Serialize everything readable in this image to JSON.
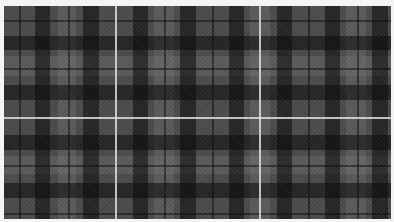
{
  "image": {
    "description": "Grey and black tartan plaid fabric swatch with thin white overcheck lines, framed by a white border",
    "colors": {
      "border": "#f4f4f4",
      "base": "#4b4b4b",
      "dark_band": "#1a1a1a",
      "light_band": "#5e5e5e",
      "overcheck": "#e1e1e1"
    },
    "vertical_dark_bands_x": [
      [
        31,
        46
      ],
      [
        79,
        95
      ],
      [
        129,
        144
      ],
      [
        176,
        192
      ],
      [
        225,
        240
      ],
      [
        273,
        288
      ],
      [
        321,
        336
      ],
      [
        368,
        384
      ]
    ],
    "vertical_light_bands_x": [
      [
        54,
        72
      ],
      [
        150,
        170
      ],
      [
        246,
        266
      ],
      [
        342,
        362
      ]
    ],
    "vertical_thin_lines_x": [
      15,
      64,
      160,
      208,
      304,
      353
    ],
    "vertical_white_lines_x": [
      111,
      255
    ],
    "horizontal_dark_bands_y": [
      [
        30,
        44
      ],
      [
        79,
        94
      ],
      [
        129,
        144
      ],
      [
        177,
        192
      ]
    ],
    "horizontal_light_bands_y": [
      [
        50,
        70
      ],
      [
        150,
        168
      ]
    ],
    "horizontal_thin_lines_y": [
      14,
      62,
      159,
      207
    ],
    "horizontal_white_lines_y": [
      111
    ]
  }
}
